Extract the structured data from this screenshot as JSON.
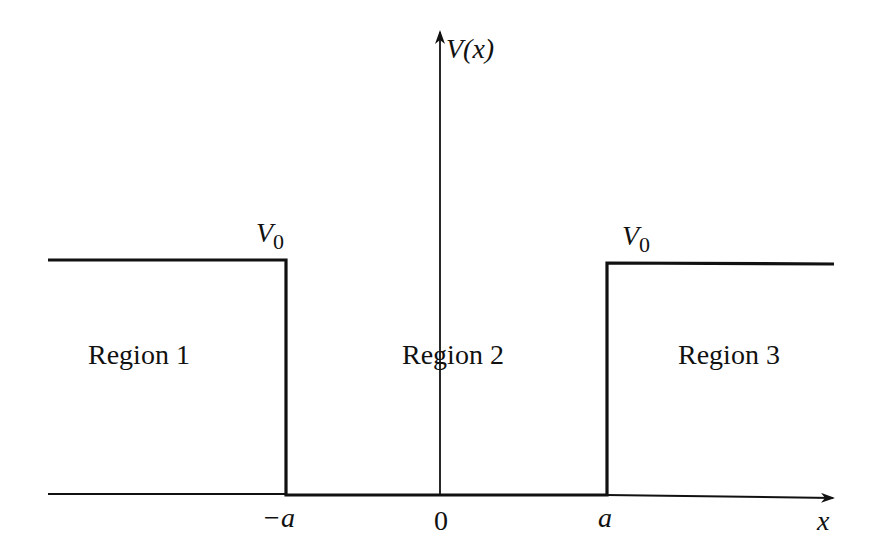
{
  "diagram": {
    "y_axis_label": "V(x)",
    "x_axis_label": "x",
    "barrier_labels": [
      "V",
      "V"
    ],
    "barrier_subscripts": [
      "0",
      "0"
    ],
    "tick_labels": [
      "−a",
      "0",
      "a"
    ],
    "regions": [
      "Region 1",
      "Region 2",
      "Region 3"
    ],
    "stroke_color": "#111111",
    "background": "#ffffff"
  }
}
